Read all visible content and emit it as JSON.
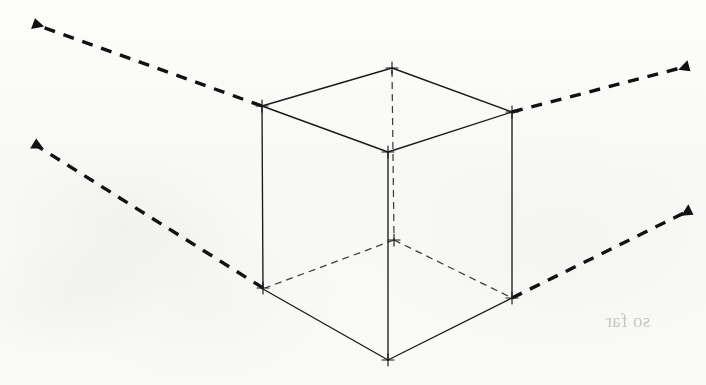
{
  "figure": {
    "type": "two-point-perspective-cube",
    "background_color": "#fbfbfa",
    "ink_color": "#1a1a1a",
    "hidden_edge_color": "#3a3a3a",
    "guide_color": "#111111",
    "width": 706,
    "height": 385
  },
  "cube": {
    "description": "Line drawing of a cube seen in two-point perspective, with vertex tick marks",
    "vertices": {
      "top_back": {
        "x": 392,
        "y": 68,
        "label": "top-back"
      },
      "top_left": {
        "x": 262,
        "y": 106,
        "label": "top-left"
      },
      "top_right": {
        "x": 512,
        "y": 112,
        "label": "top-right"
      },
      "top_front": {
        "x": 388,
        "y": 152,
        "label": "top-front"
      },
      "bottom_left": {
        "x": 263,
        "y": 288,
        "label": "bottom-left"
      },
      "bottom_right": {
        "x": 512,
        "y": 298,
        "label": "bottom-right"
      },
      "bottom_front": {
        "x": 388,
        "y": 360,
        "label": "bottom-front"
      },
      "bottom_back": {
        "x": 394,
        "y": 240,
        "label": "bottom-back-hidden"
      }
    },
    "visible_edges": [
      [
        "top_left",
        "top_back"
      ],
      [
        "top_back",
        "top_right"
      ],
      [
        "top_left",
        "top_front"
      ],
      [
        "top_front",
        "top_right"
      ],
      [
        "top_left",
        "bottom_left"
      ],
      [
        "top_right",
        "bottom_right"
      ],
      [
        "top_front",
        "bottom_front"
      ],
      [
        "bottom_left",
        "bottom_front"
      ],
      [
        "bottom_front",
        "bottom_right"
      ]
    ],
    "hidden_edges": [
      [
        "top_back",
        "bottom_back"
      ],
      [
        "bottom_back",
        "bottom_left"
      ],
      [
        "bottom_back",
        "bottom_right"
      ]
    ]
  },
  "guides": {
    "style": "dashed",
    "arrowhead": "filled-triangle",
    "lines": [
      {
        "name": "upper-left-vanishing-guide",
        "from": {
          "x": 262,
          "y": 106
        },
        "to": {
          "x": 30,
          "y": 22
        },
        "arrow_at": "to",
        "direction": "toward-left-vanishing-point"
      },
      {
        "name": "lower-left-vanishing-guide",
        "from": {
          "x": 263,
          "y": 288
        },
        "to": {
          "x": 30,
          "y": 142
        },
        "arrow_at": "to",
        "direction": "toward-left-vanishing-point"
      },
      {
        "name": "upper-right-vanishing-guide",
        "from": {
          "x": 512,
          "y": 112
        },
        "to": {
          "x": 692,
          "y": 64
        },
        "arrow_at": "to",
        "direction": "toward-right-vanishing-point"
      },
      {
        "name": "lower-right-vanishing-guide",
        "from": {
          "x": 512,
          "y": 298
        },
        "to": {
          "x": 694,
          "y": 208
        },
        "arrow_at": "to",
        "direction": "toward-right-vanishing-point"
      }
    ]
  },
  "bleed_through_text": {
    "note": "Faint mirrored text showing through from the reverse side of the scanned page; illegible",
    "lines": [
      {
        "text": "when a box needs a",
        "x": 660,
        "y": 146,
        "size": 19
      },
      {
        "text": "wide angle with a that",
        "x": 678,
        "y": 172,
        "size": 19
      },
      {
        "text": "centre lines are long is",
        "x": 672,
        "y": 199,
        "size": 19
      },
      {
        "text": "and parallel",
        "x": 620,
        "y": 226,
        "size": 19
      },
      {
        "text": "front of these two points",
        "x": 690,
        "y": 282,
        "size": 19
      },
      {
        "text": "so far",
        "x": 560,
        "y": 310,
        "size": 19
      }
    ]
  }
}
